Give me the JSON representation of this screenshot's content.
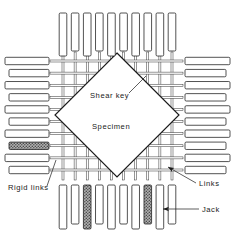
{
  "figure": {
    "name": "biaxial-loading-apparatus-diagram",
    "background_color": "#ffffff",
    "line_color": "#1a1a1a",
    "hatch_color": "#7d7d7d",
    "jack_fill": "#ffffff",
    "rigid_link_fill": "#8a8a8a"
  },
  "labels": {
    "shear_key": "Shear key",
    "specimen": "Specimen",
    "rigid_links": "Rigid links",
    "links": "Links",
    "jack": "Jack"
  },
  "specimen": {
    "label": "Specimen",
    "center_x": 117,
    "center_y": 115,
    "half_diagonal": 62,
    "rotation_deg": 45,
    "shear_key_teeth_per_edge": 11
  },
  "jack_banks": [
    {
      "name": "top-jack-bank",
      "side": "top",
      "count": 10,
      "orientation": "vertical",
      "rigid_link_indices": []
    },
    {
      "name": "bottom-jack-bank",
      "side": "bottom",
      "count": 10,
      "orientation": "vertical",
      "rigid_link_indices": [
        2,
        7
      ]
    },
    {
      "name": "left-jack-bank",
      "side": "left",
      "count": 10,
      "orientation": "horizontal",
      "rigid_link_indices": [
        7
      ]
    },
    {
      "name": "right-jack-bank",
      "side": "right",
      "count": 10,
      "orientation": "horizontal",
      "rigid_link_indices": []
    }
  ],
  "link_grid": {
    "name": "link-rod-grid",
    "vertical_rod_count": 10,
    "horizontal_rod_count": 10,
    "rod_width_px": 2
  },
  "annotations": [
    {
      "name": "shear-key-annotation",
      "text": "Shear key",
      "text_x": 90,
      "text_y": 98,
      "leader_from_x": 129,
      "leader_from_y": 93,
      "leader_to_x": 146,
      "leader_to_y": 76
    },
    {
      "name": "specimen-annotation",
      "text": "Specimen",
      "text_x": 92,
      "text_y": 129
    },
    {
      "name": "rigid-links-annotation",
      "text": "Rigid links",
      "text_x": 8,
      "text_y": 190,
      "leader_from_x": 47,
      "leader_from_y": 186,
      "leader_to_x": 56,
      "leader_to_y": 160
    },
    {
      "name": "links-annotation",
      "text": "Links",
      "text_x": 199,
      "text_y": 186,
      "leader_from_x": 196,
      "leader_from_y": 183,
      "leader_to_x": 168,
      "leader_to_y": 167
    },
    {
      "name": "jack-annotation",
      "text": "Jack",
      "text_x": 202,
      "text_y": 212,
      "leader_from_x": 199,
      "leader_from_y": 209,
      "leader_to_x": 163,
      "leader_to_y": 209
    }
  ]
}
